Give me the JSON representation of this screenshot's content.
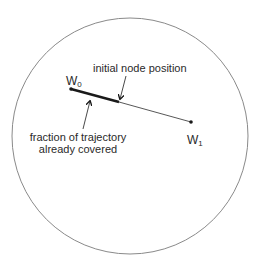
{
  "diagram": {
    "boundary": {
      "shape": "circle",
      "cx": 130,
      "cy": 136,
      "r": 118,
      "stroke": "#8a8a8a"
    },
    "waypoints": [
      {
        "id": "W0",
        "letter": "W",
        "subscript": "0",
        "x": 71,
        "y": 89
      },
      {
        "id": "W1",
        "letter": "W",
        "subscript": "1",
        "x": 191,
        "y": 122
      }
    ],
    "trajectory": {
      "from": "W0",
      "to": "W1",
      "covered_end": {
        "x": 119,
        "y": 102
      },
      "covered_stroke": "#1a1a1a",
      "remaining_stroke": "#444444"
    },
    "annotations": [
      {
        "id": "initial-node-position",
        "lines": [
          "initial node position"
        ],
        "arrow_target": {
          "x": 120,
          "y": 100
        }
      },
      {
        "id": "fraction-covered",
        "lines": [
          "fraction of trajectory",
          "already covered"
        ],
        "arrow_target": {
          "x": 90,
          "y": 100
        }
      }
    ]
  }
}
